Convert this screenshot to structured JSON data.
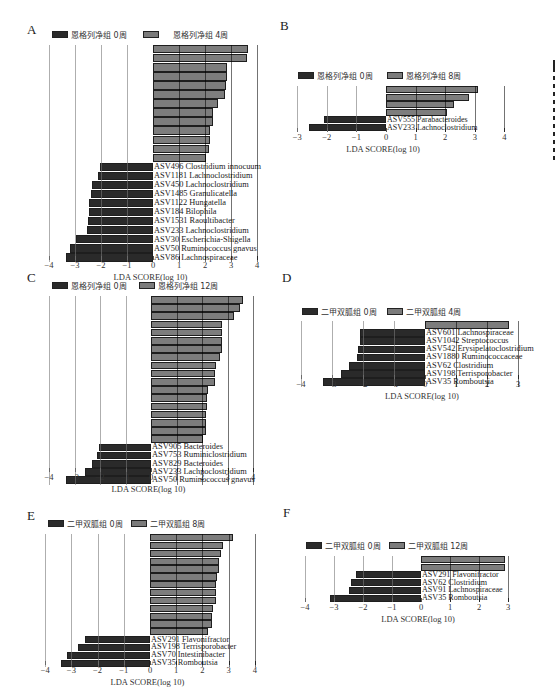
{
  "chart_data": [
    {
      "panel": "A",
      "type": "bar",
      "orientation": "horizontal",
      "legend": [
        "恩格列净组 0周",
        "恩格列净组 4周"
      ],
      "xlabel": "LDA SCORE(log 10)",
      "xticks": [
        -4,
        -3,
        -2,
        -1,
        0,
        1,
        2,
        3,
        4
      ],
      "xlim": [
        -4,
        4
      ],
      "categories": [
        "ASV15 Roseburia",
        "ASV12 Faecalibacterium",
        "ASV78 Prevotella",
        "ASV178 Roseburia",
        "ASV169 Lachnospira",
        "ASV126 Clostridium",
        "ASV110 Blautia",
        "ASV500 Enterobacteriaceae",
        "ASV265 Marvinbryantia",
        "ASV517 Acetitomaculum",
        "ASV653 Ruminococcaceae",
        "ASV823 Lachnospiraceae",
        "ASV398 Lachnospiraceae",
        "ASV496 Clostridium innocuum",
        "ASV1181 Lachnoclostridium",
        "ASV450 Lachnoclostridium",
        "ASV1485 Granulicatella",
        "ASV1122 Hungatella",
        "ASV184 Bilophila",
        "ASV1531 Raoultibacter",
        "ASV233 Lachnoclostridium",
        "ASV30 Escherichia-Shigella",
        "ASV50 Ruminococcus gnavus",
        "ASV86 Lachnospiraceae"
      ],
      "values": [
        3.65,
        3.6,
        2.85,
        2.85,
        2.8,
        2.75,
        2.5,
        2.3,
        2.3,
        2.2,
        2.2,
        2.15,
        2.05,
        -2.05,
        -2.1,
        -2.35,
        -2.4,
        -2.45,
        -2.45,
        -2.5,
        -2.55,
        -2.95,
        -3.2,
        -3.35
      ]
    },
    {
      "panel": "B",
      "type": "bar",
      "orientation": "horizontal",
      "legend": [
        "恩格列净组 0周",
        "恩格列净组 8周"
      ],
      "xlabel": "LDA SCORE(log 10)",
      "xticks": [
        -3,
        -2,
        -1,
        0,
        1,
        2,
        3,
        4
      ],
      "xlim": [
        -3,
        4
      ],
      "categories": [
        "ASV48 Coprococcus",
        "ASV125 Streptococcus",
        "ASV517 Acetitomaculum",
        "ASV2228 Faecalitalea",
        "ASV555 Parabacteroides",
        "ASV233 Lachnoclostridium"
      ],
      "values": [
        3.1,
        2.8,
        2.3,
        2.05,
        -2.1,
        -2.6
      ]
    },
    {
      "panel": "C",
      "type": "bar",
      "orientation": "horizontal",
      "legend": [
        "恩格列净组 0周",
        "恩格列净组 12周"
      ],
      "xlabel": "LDA SCORE(log 10)",
      "xticks": [
        -4,
        -3,
        -2,
        -1,
        0,
        1,
        2,
        3,
        4
      ],
      "xlim": [
        -4,
        4
      ],
      "categories": [
        "ASV12 Faecalibacterium",
        "ASV34 Eubacterium ruminantium",
        "ASV15 Roseburia",
        "ASV135 Eubacterium eligens",
        "ASV109 Ruminococcaceae",
        "ASV125 Streptococcus",
        "ASV178 Roseburia",
        "ASV2304 Eggerthellaceae",
        "ASV126 Clostridium",
        "ASV1945 Actinomyces",
        "ASV346 Eubacterium eligens",
        "ASV517 Acetitomaculum",
        "ASV837 Lachnospiraceae",
        "ASV343 Alistipes",
        "ASV413 Ruminococcaceae",
        "ASV881 Ruminiclostridium",
        "ASV335 Adlercreutzia",
        "ASV574 Lachnospiraceae",
        "ASV905 Bacteroides",
        "ASV753 Ruminiclostridium",
        "ASV829 Bacteroides",
        "ASV233 Lachnoclostridium",
        "ASV50 Ruminococcus gnavus"
      ],
      "values": [
        3.6,
        3.5,
        3.25,
        2.8,
        2.8,
        2.8,
        2.8,
        2.7,
        2.55,
        2.5,
        2.5,
        2.25,
        2.2,
        2.2,
        2.15,
        2.15,
        2.15,
        2.05,
        -2.05,
        -2.1,
        -2.3,
        -2.6,
        -3.35
      ]
    },
    {
      "panel": "D",
      "type": "bar",
      "orientation": "horizontal",
      "legend": [
        "二甲双胍组 0周",
        "二甲双胍组 4周"
      ],
      "xlabel": "LDA SCORE(log 10)",
      "xticks": [
        -4,
        -3,
        -2,
        -1,
        0,
        1,
        2,
        3
      ],
      "xlim": [
        -4,
        3
      ],
      "categories": [
        "ASV169 Lachnospira",
        "ASV601 Lachnospiraceae",
        "ASV1042 Streptococcus",
        "ASV542 Erysipelatoclostridium",
        "ASV1880 Ruminococcaceae",
        "ASV62 Clostridium",
        "ASV198 Terrisporobacter",
        "ASV35 Romboutsia"
      ],
      "values": [
        2.7,
        -2.1,
        -2.1,
        -2.15,
        -2.2,
        -2.45,
        -2.7,
        -3.3
      ]
    },
    {
      "panel": "E",
      "type": "bar",
      "orientation": "horizontal",
      "legend": [
        "二甲双胍组 0周",
        "二甲双胍组 8周"
      ],
      "xlabel": "LDA SCORE(log 10)",
      "xticks": [
        -4,
        -3,
        -2,
        -1,
        0,
        1,
        2,
        3,
        4
      ],
      "xlim": [
        -4,
        4
      ],
      "categories": [
        "ASV110 Blautia",
        "ASV974 Christensenellaceae",
        "ASV1557 Leuconostoc",
        "ASV179 Klebsiella",
        "ASV243 Klebsiella",
        "ASV178 Roseburia",
        "ASV203 Butyricicoccus",
        "ASV796 Ruminococcaceae",
        "ASV320 Blautia",
        "ASV1176 Ruminococcaceae",
        "ASV1260 Clostridiales",
        "ASV653 Ruminococcaceae",
        "ASV520 Butyricimonas",
        "ASV291 Flavonifractor",
        "ASV198 Terrisporobacter",
        "ASV70 Intestinibacter",
        "ASV35 Romboutsia"
      ],
      "values": [
        3.15,
        2.8,
        2.7,
        2.65,
        2.65,
        2.55,
        2.5,
        2.5,
        2.5,
        2.4,
        2.35,
        2.35,
        2.2,
        -2.5,
        -2.75,
        -3.15,
        -3.4
      ]
    },
    {
      "panel": "F",
      "type": "bar",
      "orientation": "horizontal",
      "legend": [
        "二甲双胍组 0周",
        "二甲双胍组 12周"
      ],
      "xlabel": "LDA SCORE(log 10)",
      "xticks": [
        -4,
        -3,
        -2,
        -1,
        0,
        1,
        2,
        3
      ],
      "xlim": [
        -4,
        3
      ],
      "categories": [
        "ASV243 Klebsiella",
        "ASV1894 Oxalobacter",
        "ASV291 Flavonifractor",
        "ASV62 Clostridium",
        "ASV91 Lachnospiraceae",
        "ASV35 Romboutsia"
      ],
      "values": [
        2.9,
        2.9,
        -2.25,
        -2.4,
        -2.5,
        -3.15
      ]
    }
  ],
  "colors": {
    "positive_bar": "#7d7d7d",
    "negative_bar": "#2a2a2a",
    "bar_border": "#1e1e1e"
  },
  "panels": {
    "A": {
      "letter": "A",
      "legend_dark": "恩格列净组 0周",
      "legend_light": "恩格列净组 4周",
      "xlabel": "LDA SCORE(log 10)"
    },
    "B": {
      "letter": "B",
      "legend_dark": "恩格列净组 0周",
      "legend_light": "恩格列净组 8周",
      "xlabel": "LDA SCORE(log 10)"
    },
    "C": {
      "letter": "C",
      "legend_dark": "恩格列净组 0周",
      "legend_light": "恩格列净组 12周",
      "xlabel": "LDA SCORE(log 10)"
    },
    "D": {
      "letter": "D",
      "legend_dark": "二甲双胍组 0周",
      "legend_light": "二甲双胍组 4周",
      "xlabel": "LDA SCORE(log 10)"
    },
    "E": {
      "letter": "E",
      "legend_dark": "二甲双胍组 0周",
      "legend_light": "二甲双胍组 8周",
      "xlabel": "LDA SCORE(log 10)"
    },
    "F": {
      "letter": "F",
      "legend_dark": "二甲双胍组 0周",
      "legend_light": "二甲双胍组 12周",
      "xlabel": "LDA SCORE(log 10)"
    }
  }
}
